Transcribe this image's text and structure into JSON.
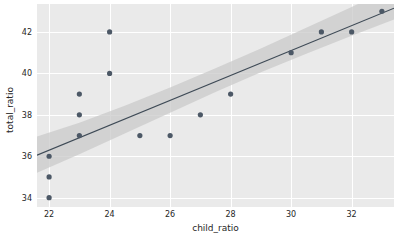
{
  "chart_data": {
    "type": "scatter",
    "title": "",
    "xlabel": "child_ratio",
    "ylabel": "total_ratio",
    "xlim": [
      21.6,
      33.4
    ],
    "ylim": [
      33.55,
      43.35
    ],
    "xticks": [
      22,
      24,
      26,
      28,
      30,
      32
    ],
    "yticks": [
      34,
      36,
      38,
      40,
      42
    ],
    "grid": true,
    "legend": null,
    "points": [
      {
        "x": 22,
        "y": 36
      },
      {
        "x": 22,
        "y": 35
      },
      {
        "x": 22,
        "y": 34
      },
      {
        "x": 23,
        "y": 39
      },
      {
        "x": 23,
        "y": 38
      },
      {
        "x": 23,
        "y": 37
      },
      {
        "x": 24,
        "y": 42
      },
      {
        "x": 24,
        "y": 40
      },
      {
        "x": 25,
        "y": 37
      },
      {
        "x": 26,
        "y": 37
      },
      {
        "x": 27,
        "y": 38
      },
      {
        "x": 28,
        "y": 39
      },
      {
        "x": 30,
        "y": 41
      },
      {
        "x": 31,
        "y": 42
      },
      {
        "x": 32,
        "y": 42
      },
      {
        "x": 33,
        "y": 43
      }
    ],
    "regression_line": {
      "x_start": 21.6,
      "y_start": 36.05,
      "x_end": 33.4,
      "y_end": 43.15
    },
    "confidence_band": {
      "upper": [
        {
          "x": 21.6,
          "y": 36.95
        },
        {
          "x": 23.0,
          "y": 37.62
        },
        {
          "x": 24.5,
          "y": 38.44
        },
        {
          "x": 26.0,
          "y": 39.32
        },
        {
          "x": 27.5,
          "y": 40.25
        },
        {
          "x": 29.0,
          "y": 41.2
        },
        {
          "x": 30.5,
          "y": 42.2
        },
        {
          "x": 32.0,
          "y": 43.2
        },
        {
          "x": 33.4,
          "y": 44.2
        }
      ],
      "lower": [
        {
          "x": 21.6,
          "y": 35.2
        },
        {
          "x": 23.0,
          "y": 36.1
        },
        {
          "x": 24.5,
          "y": 37.1
        },
        {
          "x": 26.0,
          "y": 38.1
        },
        {
          "x": 27.5,
          "y": 39.1
        },
        {
          "x": 29.0,
          "y": 40.05
        },
        {
          "x": 30.5,
          "y": 40.95
        },
        {
          "x": 32.0,
          "y": 41.82
        },
        {
          "x": 33.4,
          "y": 42.6
        }
      ]
    },
    "colors": {
      "panel_background": "#eaeaea",
      "gridline": "#ffffff",
      "point": "#4c5866",
      "line": "#3e4a56",
      "band": "#c9c9c9",
      "text": "#262626",
      "figure_background": "#ffffff"
    },
    "marker_size": 2.6
  }
}
